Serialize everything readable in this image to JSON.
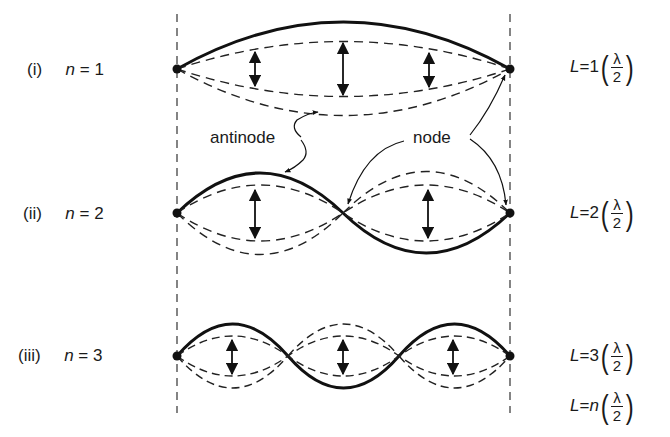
{
  "figure": {
    "rows": [
      {
        "roman": "(i)",
        "n_label": "n",
        "n_value": "1",
        "equation": {
          "L": "L",
          "multiplier": "1",
          "numerator": "λ",
          "denominator": "2"
        }
      },
      {
        "roman": "(ii)",
        "n_label": "n",
        "n_value": "2",
        "equation": {
          "L": "L",
          "multiplier": "2",
          "numerator": "λ",
          "denominator": "2"
        }
      },
      {
        "roman": "(iii)",
        "n_label": "n",
        "n_value": "3",
        "equation": {
          "L": "L",
          "multiplier": "3",
          "numerator": "λ",
          "denominator": "2"
        }
      }
    ],
    "general_equation": {
      "L": "L",
      "multiplier": "n",
      "numerator": "λ",
      "denominator": "2"
    },
    "annotations": {
      "antinode": "antinode",
      "node": "node"
    },
    "equals": "="
  }
}
